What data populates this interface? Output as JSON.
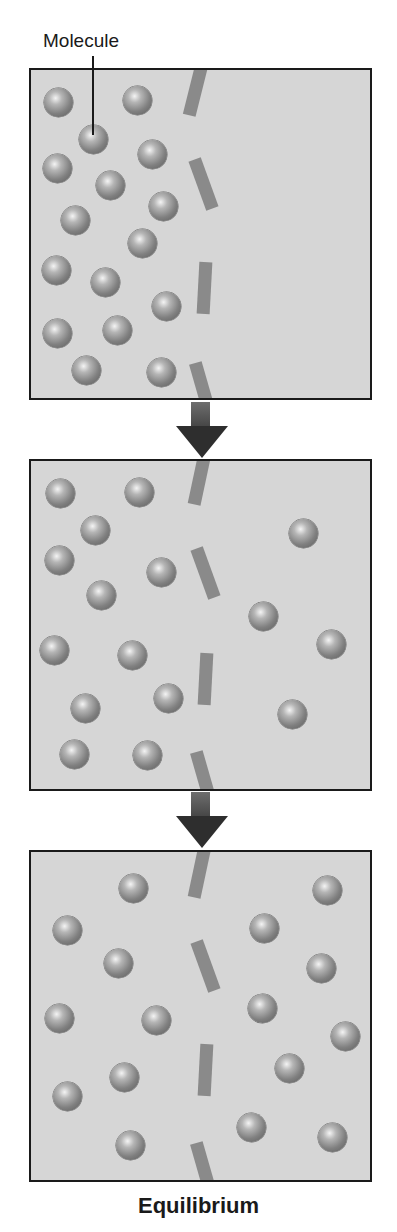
{
  "labels": {
    "molecule": "Molecule",
    "equilibrium": "Equilibrium"
  },
  "colors": {
    "panel_bg": "#d6d6d6",
    "border": "#1a1a1a",
    "membrane": "#8a8a8a",
    "arrow": "#2e2e2e",
    "molecule": "#808080"
  },
  "panels": [
    {
      "name": "initial-state",
      "top": 68,
      "molecules_left": 16,
      "molecules_right": 0,
      "molecules": [
        [
          58,
          102
        ],
        [
          137,
          100
        ],
        [
          93,
          139
        ],
        [
          152,
          154
        ],
        [
          57,
          168
        ],
        [
          110,
          185
        ],
        [
          163,
          206
        ],
        [
          75,
          220
        ],
        [
          142,
          243
        ],
        [
          56,
          270
        ],
        [
          105,
          282
        ],
        [
          166,
          306
        ],
        [
          57,
          333
        ],
        [
          117,
          330
        ],
        [
          86,
          370
        ],
        [
          161,
          372
        ]
      ]
    },
    {
      "name": "diffusing-state",
      "top": 459,
      "molecules_left": 12,
      "molecules_right": 4,
      "molecules": [
        [
          60,
          493
        ],
        [
          139,
          492
        ],
        [
          95,
          530
        ],
        [
          59,
          560
        ],
        [
          161,
          572
        ],
        [
          101,
          595
        ],
        [
          54,
          650
        ],
        [
          132,
          655
        ],
        [
          85,
          708
        ],
        [
          168,
          698
        ],
        [
          74,
          754
        ],
        [
          147,
          755
        ],
        [
          303,
          533
        ],
        [
          263,
          616
        ],
        [
          331,
          644
        ],
        [
          292,
          714
        ]
      ]
    },
    {
      "name": "equilibrium-state",
      "top": 850,
      "molecules_left": 8,
      "molecules_right": 8,
      "molecules": [
        [
          133,
          888
        ],
        [
          67,
          930
        ],
        [
          118,
          963
        ],
        [
          59,
          1018
        ],
        [
          156,
          1020
        ],
        [
          124,
          1077
        ],
        [
          67,
          1096
        ],
        [
          130,
          1145
        ],
        [
          327,
          890
        ],
        [
          264,
          928
        ],
        [
          321,
          968
        ],
        [
          262,
          1008
        ],
        [
          345,
          1036
        ],
        [
          289,
          1068
        ],
        [
          251,
          1127
        ],
        [
          332,
          1137
        ]
      ]
    }
  ],
  "arrows": [
    {
      "top": 404
    },
    {
      "top": 794
    }
  ]
}
